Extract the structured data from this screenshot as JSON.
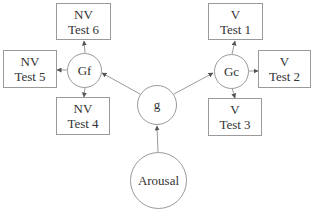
{
  "diagram": {
    "type": "factor-model",
    "nodes": {
      "arousal": {
        "label": "Arousal"
      },
      "g": {
        "label": "g"
      },
      "gf": {
        "label": "Gf"
      },
      "gc": {
        "label": "Gc"
      }
    },
    "tests": {
      "nv6": {
        "line1": "NV",
        "line2": "Test 6"
      },
      "nv5": {
        "line1": "NV",
        "line2": "Test 5"
      },
      "nv4": {
        "line1": "NV",
        "line2": "Test 4"
      },
      "v1": {
        "line1": "V",
        "line2": "Test 1"
      },
      "v2": {
        "line1": "V",
        "line2": "Test 2"
      },
      "v3": {
        "line1": "V",
        "line2": "Test 3"
      }
    },
    "edges": [
      {
        "from": "Arousal",
        "to": "g"
      },
      {
        "from": "g",
        "to": "Gf"
      },
      {
        "from": "g",
        "to": "Gc"
      },
      {
        "from": "Gf",
        "to": "NV Test 6"
      },
      {
        "from": "Gf",
        "to": "NV Test 5"
      },
      {
        "from": "Gf",
        "to": "NV Test 4"
      },
      {
        "from": "Gc",
        "to": "V Test 1"
      },
      {
        "from": "Gc",
        "to": "V Test 2"
      },
      {
        "from": "Gc",
        "to": "V Test 3"
      }
    ],
    "colors": {
      "stroke": "#9a9a9a",
      "text": "#333333",
      "arrow": "#555555"
    }
  }
}
